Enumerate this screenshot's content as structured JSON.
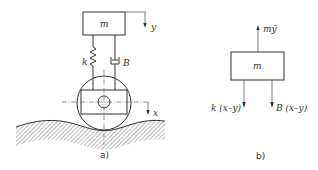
{
  "panel_a": {
    "caption": "a)",
    "mass_label": "m",
    "spring_label": "k",
    "damper_label": "B",
    "y_axis_label": "y",
    "x_axis_label": "x"
  },
  "panel_b": {
    "caption": "b)",
    "mass_label": "m",
    "inertia_force_label": "mÿ",
    "spring_force_label": "k (x–y)",
    "damper_force_label": "B (x–y)"
  },
  "colors": {
    "line": "#333333",
    "background": "#ffffff"
  }
}
